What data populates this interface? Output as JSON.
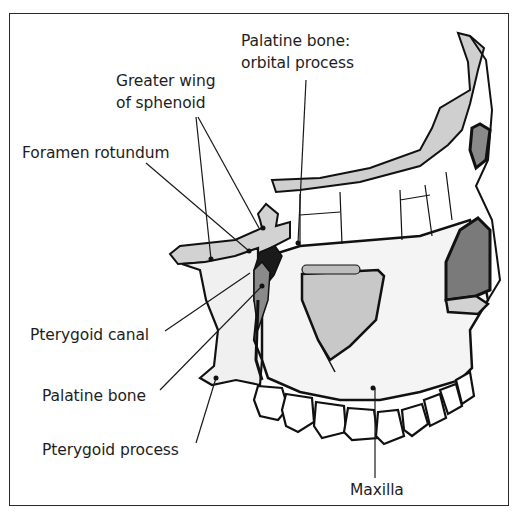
{
  "figure": {
    "labels": {
      "palatine_orbital_line1": "Palatine bone:",
      "palatine_orbital_line2": "orbital process",
      "greater_wing_line1": "Greater wing",
      "greater_wing_line2": "of sphenoid",
      "foramen_rotundum": "Foramen rotundum",
      "pterygoid_canal": "Pterygoid canal",
      "palatine_bone": "Palatine bone",
      "pterygoid_process": "Pterygoid process",
      "maxilla": "Maxilla"
    },
    "colors": {
      "outline": "#111111",
      "bone_fill": "#f4f4f4",
      "light_gray": "#cfcfcf",
      "mid_gray": "#8a8a8a",
      "dark": "#1a1a1a"
    }
  }
}
